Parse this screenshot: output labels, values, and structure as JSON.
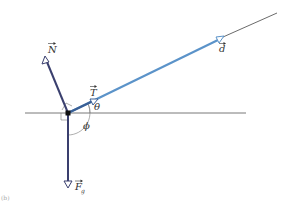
{
  "figure": {
    "panel_label": "(b)",
    "colors": {
      "axis_line": "#555555",
      "extension_line": "#444444",
      "force_vector": "#3a3f6e",
      "displacement_vector": "#5b93c9",
      "angle_marks": "#777777",
      "junction": "#111111"
    },
    "vectors": [
      {
        "name": "normal-force",
        "label": "N"
      },
      {
        "name": "tension",
        "label": "T"
      },
      {
        "name": "displacement",
        "label": "d"
      },
      {
        "name": "gravity",
        "label": "F",
        "subscript": "g"
      }
    ],
    "angles": [
      {
        "name": "theta",
        "label": "θ"
      },
      {
        "name": "phi",
        "label": "ϕ"
      }
    ]
  }
}
